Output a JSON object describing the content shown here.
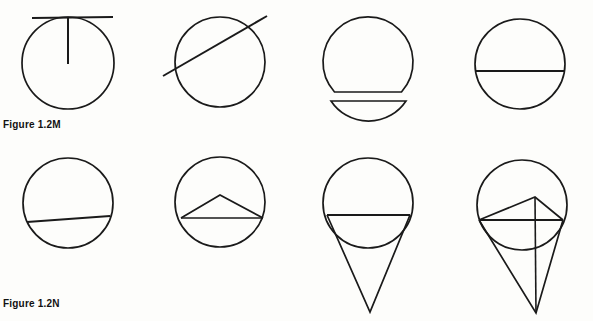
{
  "page": {
    "background_color": "#fdfdfb",
    "ink_color": "#1a1a1a",
    "width": 593,
    "height": 321
  },
  "captions": {
    "top": "Figure 1.2M",
    "bottom": "Figure 1.2N"
  },
  "diagram": {
    "stroke_color": "#1a1a1a",
    "stroke_width": 1.7,
    "rows": [
      {
        "row_name": "row-top",
        "caption_ref": "Figure 1.2M",
        "figures": [
          {
            "name": "circle-with-tangent-and-radius",
            "index": 1,
            "description": "Circle with horizontal tangent line at top and vertical radius drawn from tangent point to center",
            "circle": {
              "cx": 68,
              "cy": 63,
              "r": 46
            },
            "tangent_line": {
              "x1": 32,
              "y1": 18,
              "x2": 113,
              "y2": 17
            },
            "radius_line": {
              "x1": 68,
              "y1": 18,
              "x2": 68,
              "y2": 64
            }
          },
          {
            "name": "circle-with-secant",
            "index": 2,
            "description": "Circle crossed by a diagonal secant line extending beyond the circle on both ends",
            "circle": {
              "cx": 220,
              "cy": 62,
              "r": 45
            },
            "secant_line": {
              "x1": 163,
              "y1": 76,
              "x2": 267,
              "y2": 16
            }
          },
          {
            "name": "circle-split-into-segments",
            "index": 3,
            "description": "Circle cut by a chord; the minor segment is detached and drawn below the major segment",
            "circle": {
              "cx": 368,
              "cy": 62,
              "r": 45
            },
            "chord_y": 92,
            "detached_segment": {
              "chord": {
                "x1": 331,
                "y1": 101,
                "x2": 406,
                "y2": 101
              },
              "arc_depth": 13
            }
          },
          {
            "name": "circle-with-diameter",
            "index": 4,
            "description": "Circle with a horizontal diameter drawn through the center",
            "circle": {
              "cx": 520,
              "cy": 64,
              "r": 45
            },
            "diameter_line": {
              "x1": 475,
              "y1": 71,
              "x2": 565,
              "y2": 71
            }
          }
        ]
      },
      {
        "row_name": "row-bottom",
        "caption_ref": "Figure 1.2N",
        "figures": [
          {
            "name": "circle-with-chord",
            "index": 5,
            "description": "Circle with a slightly tilted chord below the center",
            "circle": {
              "cx": 68,
              "cy": 203,
              "r": 45
            },
            "chord_line": {
              "x1": 27,
              "y1": 222,
              "x2": 110,
              "y2": 216
            }
          },
          {
            "name": "circle-with-inscribed-triangle",
            "index": 6,
            "description": "Circle with a horizontal chord and an isosceles triangle rising from the chord to an apex above it",
            "circle": {
              "cx": 220,
              "cy": 202,
              "r": 45
            },
            "chord_line": {
              "x1": 181,
              "y1": 218,
              "x2": 263,
              "y2": 218
            },
            "triangle": {
              "apex_x": 220,
              "apex_y": 195,
              "left_x": 181,
              "left_y": 218,
              "right_x": 263,
              "right_y": 218
            }
          },
          {
            "name": "circle-with-cone",
            "index": 7,
            "description": "Circle with a horizontal chord and a long narrow triangle descending from chord endpoints to a point below",
            "circle": {
              "cx": 368,
              "cy": 203,
              "r": 45
            },
            "chord_line": {
              "x1": 327,
              "y1": 215,
              "x2": 410,
              "y2": 215
            },
            "cone": {
              "left_x": 327,
              "left_y": 215,
              "right_x": 410,
              "right_y": 215,
              "apex_x": 370,
              "apex_y": 312
            }
          },
          {
            "name": "circle-with-cone-triangle-and-axis",
            "index": 8,
            "description": "Combined construction: circle, chord, upward inscribed triangle, downward cone triangle, and a vertical axis line from the triangle apex to the cone point",
            "circle": {
              "cx": 522,
              "cy": 205,
              "r": 45
            },
            "chord_line": {
              "x1": 479,
              "y1": 220,
              "x2": 563,
              "y2": 220
            },
            "triangle": {
              "apex_x": 535,
              "apex_y": 197,
              "left_x": 479,
              "left_y": 220,
              "right_x": 563,
              "right_y": 220
            },
            "cone": {
              "left_x": 479,
              "left_y": 220,
              "right_x": 563,
              "right_y": 220,
              "apex_x": 536,
              "apex_y": 313
            },
            "axis_line": {
              "x1": 535,
              "y1": 197,
              "x2": 536,
              "y2": 313
            }
          }
        ]
      }
    ]
  }
}
